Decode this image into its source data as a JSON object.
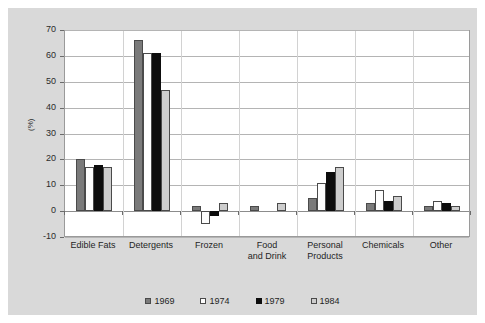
{
  "chart_data": {
    "type": "bar",
    "title": "",
    "subtitle": "",
    "xlabel": "",
    "ylabel": "(%)",
    "ylim": [
      -10,
      70
    ],
    "yticks": [
      -10,
      0,
      10,
      20,
      30,
      40,
      50,
      60,
      70
    ],
    "ytick_labels": [
      "-10",
      "0",
      "10",
      "20",
      "30",
      "40",
      "50",
      "60",
      "70"
    ],
    "grid": true,
    "legend_position": "bottom",
    "categories": [
      "Edible Fats",
      "Detergents",
      "Frozen",
      "Food and Drink",
      "Personal Products",
      "Chemicals",
      "Other"
    ],
    "category_lines": [
      [
        "Edible Fats"
      ],
      [
        "Detergents"
      ],
      [
        "Frozen"
      ],
      [
        "Food",
        "and Drink"
      ],
      [
        "Personal",
        "Products"
      ],
      [
        "Chemicals"
      ],
      [
        "Other"
      ]
    ],
    "series": [
      {
        "name": "1969",
        "color": "#7a7a7a",
        "values": [
          20,
          66,
          2,
          2,
          5,
          3,
          2
        ]
      },
      {
        "name": "1974",
        "color": "#fdfdfd",
        "values": [
          17,
          61,
          -5,
          0,
          11,
          8,
          4
        ]
      },
      {
        "name": "1979",
        "color": "#0d0d0d",
        "values": [
          18,
          61,
          -2,
          0,
          15,
          4,
          3
        ]
      },
      {
        "name": "1984",
        "color": "#cdcdcd",
        "values": [
          17,
          47,
          3,
          3,
          17,
          6,
          2
        ]
      }
    ]
  },
  "legend": {
    "entries": [
      {
        "label": "1969"
      },
      {
        "label": "1974"
      },
      {
        "label": "1979"
      },
      {
        "label": "1984"
      }
    ]
  },
  "colors": {
    "background": "#d9d9d9",
    "plot_background": "#ffffff",
    "gridline": "#b4b4b4",
    "axis": "#6b6b6b",
    "text": "#1f1f1f"
  }
}
